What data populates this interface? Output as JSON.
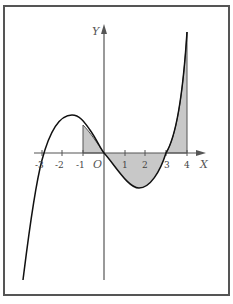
{
  "figure": {
    "y_axis_label": "Y",
    "x_axis_label": "X",
    "origin_label": "O",
    "x_ticks": [
      "-3",
      "-2",
      "-1",
      "1",
      "2",
      "3",
      "4"
    ],
    "curve_color": "#111111",
    "shade_color": "#c8c8c8",
    "axis_color": "#555555",
    "border_color": "#555555",
    "shaded_regions": [
      {
        "from": "-1",
        "to": "0"
      },
      {
        "from": "0",
        "to": "3"
      },
      {
        "from": "3",
        "to": "4"
      }
    ]
  }
}
